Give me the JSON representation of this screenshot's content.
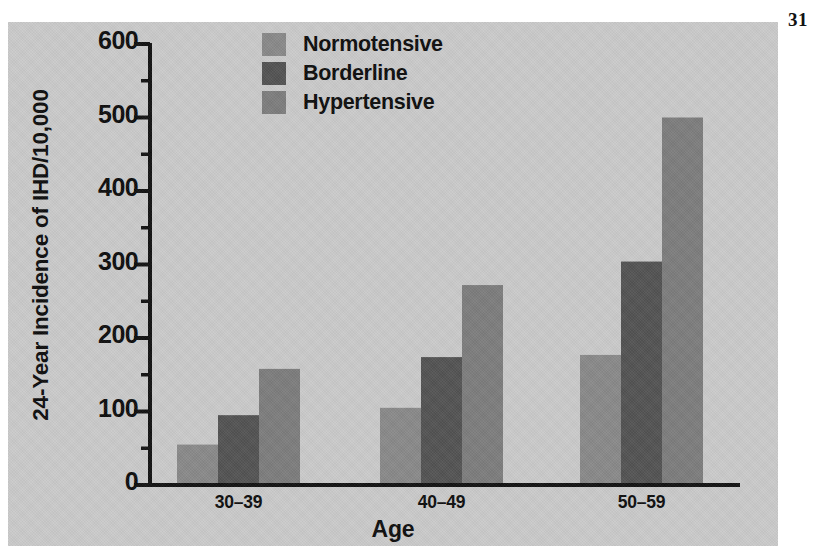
{
  "page": {
    "number": "31"
  },
  "figure": {
    "background_color": "#c9c9c9",
    "axis_color": "#111111"
  },
  "legend": {
    "position": "top-center",
    "entries": [
      {
        "label": "Normotensive",
        "color": "#888888",
        "swatch_name": "legend-swatch-normotensive"
      },
      {
        "label": "Borderline",
        "color": "#525252",
        "swatch_name": "legend-swatch-borderline"
      },
      {
        "label": "Hypertensive",
        "color": "#7c7c7c",
        "swatch_name": "legend-swatch-hypertensive"
      }
    ]
  },
  "axes": {
    "y_title": "24-Year Incidence of IHD/10,000",
    "x_title": "Age",
    "y_ticks": [
      "600",
      "500",
      "400",
      "300",
      "200",
      "100",
      "0"
    ],
    "x_ticks": [
      "30–39",
      "40–49",
      "50–59"
    ]
  },
  "chart_data": {
    "type": "bar",
    "title": "",
    "subtitle": "",
    "xlabel": "Age",
    "ylabel": "24-Year Incidence of IHD/10,000",
    "categories": [
      "30–39",
      "40–49",
      "50–59"
    ],
    "series": [
      {
        "name": "Normotensive",
        "color": "#888888",
        "values": [
          55,
          105,
          177
        ]
      },
      {
        "name": "Borderline",
        "color": "#525252",
        "values": [
          95,
          174,
          304
        ]
      },
      {
        "name": "Hypertensive",
        "color": "#7c7c7c",
        "values": [
          158,
          272,
          500
        ]
      }
    ],
    "ylim": [
      0,
      600
    ],
    "y_major_tick_step": 100,
    "y_minor_tick_step": 50,
    "grid": false,
    "legend_position": "top-center",
    "annotations": []
  }
}
